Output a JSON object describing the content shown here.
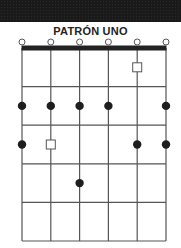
{
  "title": "PATRÓN UNO",
  "diagram": {
    "strings": 6,
    "frets": 5,
    "open_strings": [
      1,
      2,
      3,
      4,
      5,
      6
    ],
    "markers": [
      {
        "fret": 1,
        "string": 5,
        "shape": "square"
      },
      {
        "fret": 2,
        "string": 1,
        "shape": "dot"
      },
      {
        "fret": 2,
        "string": 2,
        "shape": "dot"
      },
      {
        "fret": 2,
        "string": 3,
        "shape": "dot"
      },
      {
        "fret": 2,
        "string": 4,
        "shape": "dot"
      },
      {
        "fret": 2,
        "string": 6,
        "shape": "dot"
      },
      {
        "fret": 3,
        "string": 1,
        "shape": "dot"
      },
      {
        "fret": 3,
        "string": 2,
        "shape": "square"
      },
      {
        "fret": 3,
        "string": 5,
        "shape": "dot"
      },
      {
        "fret": 3,
        "string": 6,
        "shape": "dot"
      },
      {
        "fret": 4,
        "string": 3,
        "shape": "dot"
      }
    ],
    "colors": {
      "line": "#555555",
      "nut": "#222222",
      "dot": "#1e1e1e",
      "square_stroke": "#555555"
    }
  }
}
